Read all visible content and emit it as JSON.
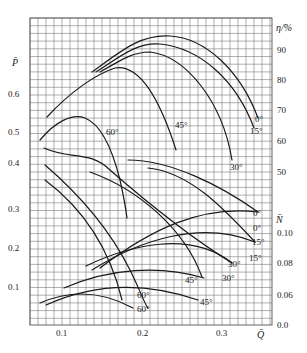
{
  "chart_data": {
    "type": "line",
    "title": "",
    "xlabel": "Q̄",
    "ylabel_left": "P̄",
    "ylabel_right_top": "η/%",
    "ylabel_right_bottom": "N̄",
    "xlim": [
      0.06,
      0.36
    ],
    "x_ticks": [
      "0.1",
      "0.2",
      "0.3"
    ],
    "y_left_ticks": [
      "0.6",
      "0.5",
      "0.4",
      "0.3",
      "0.2",
      "0.1"
    ],
    "y_right_eta_ticks": [
      "90",
      "80",
      "70",
      "60",
      "50"
    ],
    "y_right_N_ticks": [
      "0.10",
      "0.08",
      "0.06",
      "0.0"
    ],
    "grid": true,
    "legend": "inline curve labels (blade angle)",
    "series": [
      {
        "name": "η 0°",
        "axis": "eta",
        "points": [
          [
            0.17,
            83
          ],
          [
            0.21,
            91
          ],
          [
            0.24,
            93
          ],
          [
            0.28,
            88
          ],
          [
            0.31,
            78
          ],
          [
            0.34,
            66
          ]
        ],
        "label": "0°"
      },
      {
        "name": "η 15°",
        "axis": "eta",
        "points": [
          [
            0.17,
            83
          ],
          [
            0.21,
            89
          ],
          [
            0.23,
            90.5
          ],
          [
            0.27,
            86
          ],
          [
            0.31,
            75
          ],
          [
            0.34,
            63
          ]
        ],
        "label": "15°"
      },
      {
        "name": "η 30°",
        "axis": "eta",
        "points": [
          [
            0.17,
            82
          ],
          [
            0.2,
            87.5
          ],
          [
            0.22,
            88
          ],
          [
            0.26,
            80
          ],
          [
            0.29,
            67
          ],
          [
            0.31,
            52
          ]
        ],
        "label": "30°"
      },
      {
        "name": "η 45°",
        "axis": "eta",
        "points": [
          [
            0.08,
            73
          ],
          [
            0.12,
            80
          ],
          [
            0.16,
            84
          ],
          [
            0.18,
            84
          ],
          [
            0.21,
            76
          ],
          [
            0.24,
            58
          ]
        ],
        "label": "45°"
      },
      {
        "name": "P̄ 60°",
        "axis": "P",
        "points": [
          [
            0.07,
            0.48
          ],
          [
            0.1,
            0.52
          ],
          [
            0.13,
            0.53
          ],
          [
            0.16,
            0.48
          ],
          [
            0.18,
            0.36
          ],
          [
            0.185,
            0.23
          ]
        ],
        "label": "60°"
      },
      {
        "name": "P̄ 0°",
        "axis": "P",
        "points": [
          [
            0.18,
            0.47
          ],
          [
            0.23,
            0.45
          ],
          [
            0.28,
            0.38
          ],
          [
            0.34,
            0.27
          ]
        ],
        "label": "0°"
      },
      {
        "name": "P̄ 15°",
        "axis": "P",
        "points": [
          [
            0.14,
            0.46
          ],
          [
            0.2,
            0.43
          ],
          [
            0.26,
            0.36
          ],
          [
            0.34,
            0.2
          ]
        ],
        "label": "15°"
      },
      {
        "name": "P̄ 30°",
        "axis": "P",
        "points": [
          [
            0.1,
            0.45
          ],
          [
            0.15,
            0.43
          ],
          [
            0.21,
            0.35
          ],
          [
            0.27,
            0.2
          ],
          [
            0.31,
            0.15
          ]
        ],
        "label": "30°"
      },
      {
        "name": "P̄ 45°",
        "axis": "P",
        "points": [
          [
            0.08,
            0.4
          ],
          [
            0.13,
            0.32
          ],
          [
            0.17,
            0.22
          ],
          [
            0.2,
            0.1
          ],
          [
            0.22,
            0.05
          ]
        ],
        "label": "45°"
      },
      {
        "name": "N̄ 0°",
        "axis": "N",
        "points": [
          [
            0.14,
            0.082
          ],
          [
            0.2,
            0.095
          ],
          [
            0.26,
            0.105
          ],
          [
            0.31,
            0.108
          ],
          [
            0.34,
            0.106
          ]
        ],
        "label": "0°"
      },
      {
        "name": "N̄ 15°",
        "axis": "N",
        "points": [
          [
            0.13,
            0.078
          ],
          [
            0.19,
            0.09
          ],
          [
            0.25,
            0.098
          ],
          [
            0.3,
            0.097
          ],
          [
            0.34,
            0.09
          ]
        ],
        "label": "15°"
      },
      {
        "name": "N̄ 30°",
        "axis": "N",
        "points": [
          [
            0.13,
            0.078
          ],
          [
            0.19,
            0.088
          ],
          [
            0.24,
            0.091
          ],
          [
            0.28,
            0.085
          ],
          [
            0.31,
            0.075
          ]
        ],
        "label": "30°"
      },
      {
        "name": "N̄ 45°",
        "axis": "N",
        "points": [
          [
            0.1,
            0.06
          ],
          [
            0.15,
            0.07
          ],
          [
            0.2,
            0.07
          ],
          [
            0.24,
            0.065
          ],
          [
            0.28,
            0.048
          ]
        ],
        "label": "45°"
      },
      {
        "name": "N̄ 60°",
        "axis": "N",
        "points": [
          [
            0.07,
            0.045
          ],
          [
            0.1,
            0.052
          ],
          [
            0.14,
            0.052
          ],
          [
            0.18,
            0.042
          ],
          [
            0.2,
            0.033
          ]
        ],
        "label": "60°"
      }
    ]
  },
  "labels": {
    "x_axis": "Q̄",
    "y_left": "P̄",
    "y_right_eta": "η/%",
    "y_right_N": "N̄",
    "xt1": "0.1",
    "xt2": "0.2",
    "xt3": "0.3",
    "pl6": "0.6",
    "pl5": "0.5",
    "pl4": "0.4",
    "pl3": "0.3",
    "pl2": "0.2",
    "pl1": "0.1",
    "e90": "90",
    "e80": "80",
    "e70": "70",
    "e60": "60",
    "e50": "50",
    "n10": "0.10",
    "n08": "0.08",
    "n06": "0.06",
    "n00": "0.0",
    "c_eta0": "0°",
    "c_eta15": "15°",
    "c_eta30": "30°",
    "c_eta45": "45°",
    "c_p60": "60°",
    "c_n0a": "0°",
    "c_n0b": "0°",
    "c_n15a": "15°",
    "c_n15b": "15°",
    "c_n30a": "30°",
    "c_n30b": "30°",
    "c_n45a": "45°",
    "c_n45b": "45°",
    "c_n60a": "60°",
    "c_n60b": "60°"
  }
}
